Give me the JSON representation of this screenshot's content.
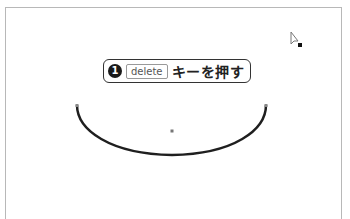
{
  "callout": {
    "step_number": "1",
    "key_label": "delete",
    "instruction": "キーを押す"
  },
  "canvas": {
    "shape": "arc",
    "stroke_color": "#1f1f1f",
    "center_point_color": "#777777"
  },
  "icons": {
    "cursor": "arrow-pointer-icon"
  }
}
